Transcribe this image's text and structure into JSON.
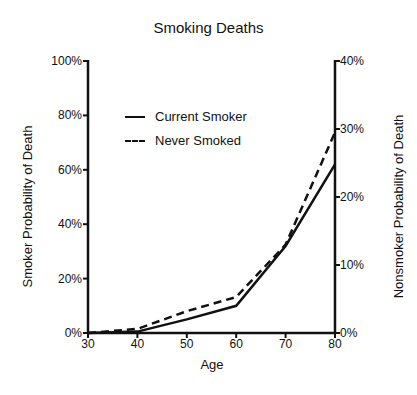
{
  "chart_data": {
    "type": "line",
    "title": "Smoking Deaths",
    "xlabel": "Age",
    "ylabel": "Smoker Probability of Death",
    "ylabel_right": "Nonsmoker Probability of Death",
    "x": [
      30,
      40,
      50,
      60,
      70,
      80
    ],
    "xlim": [
      30,
      80
    ],
    "ylim": [
      0,
      100
    ],
    "ylim_right": [
      0,
      40
    ],
    "xticks": [
      "30",
      "40",
      "50",
      "60",
      "70",
      "80"
    ],
    "yticks": [
      "0%",
      "20%",
      "40%",
      "60%",
      "80%",
      "100%"
    ],
    "yticks_right": [
      "0%",
      "10%",
      "20%",
      "30%",
      "40%"
    ],
    "series": [
      {
        "name": "Current Smoker",
        "axis": "left",
        "style": "solid",
        "values": [
          0,
          0.5,
          5,
          10,
          32,
          62
        ]
      },
      {
        "name": "Never Smoked",
        "axis": "right",
        "style": "dashed",
        "values": [
          0,
          0.6,
          3.2,
          5.3,
          13,
          29.5
        ]
      }
    ],
    "grid": false,
    "legend_position": "upper-left-inside"
  },
  "labels": {
    "title": "Smoking Deaths",
    "xlabel": "Age",
    "ylabel_left": "Smoker Probability of Death",
    "ylabel_right": "Nonsmoker Probability of Death",
    "legend": [
      "Current Smoker",
      "Never Smoked"
    ]
  }
}
